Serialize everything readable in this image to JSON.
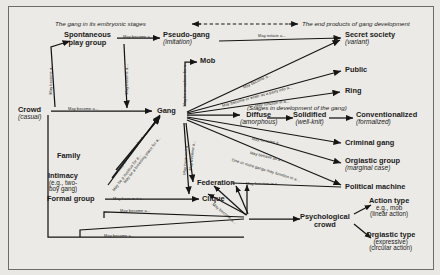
{
  "diagram": {
    "title_left": "The gang in its embryonic stages",
    "title_right": "The end products of gang development",
    "stages_caption": "(Stages in development of the gang)",
    "nodes": [
      {
        "id": "crowd",
        "bold": "Crowd",
        "ital": "(casual)"
      },
      {
        "id": "spontaneous",
        "bold": "Spontaneous",
        "bold2": "play group",
        "ital": ""
      },
      {
        "id": "pseudo",
        "bold": "Pseudo-gang",
        "ital": "(imitation)"
      },
      {
        "id": "gang",
        "bold": "Gang",
        "ital": ""
      },
      {
        "id": "mob",
        "bold": "Mob",
        "ital": ""
      },
      {
        "id": "secret",
        "bold": "Secret society",
        "ital": "(variant)"
      },
      {
        "id": "public",
        "bold": "Public",
        "ital": ""
      },
      {
        "id": "ring",
        "bold": "Ring",
        "ital": ""
      },
      {
        "id": "diffuse",
        "bold": "Diffuse",
        "ital": "(amorphous)"
      },
      {
        "id": "solidified",
        "bold": "Solidified",
        "ital": "(well-knit)"
      },
      {
        "id": "conventionalized",
        "bold": "Conventionalized",
        "ital": "(formalized)"
      },
      {
        "id": "criminal",
        "bold": "Criminal gang",
        "ital": ""
      },
      {
        "id": "orgiastic",
        "bold": "Orgiastic group",
        "ital": "(marginal case)"
      },
      {
        "id": "political",
        "bold": "Political machine",
        "ital": ""
      },
      {
        "id": "family",
        "bold": "Family",
        "ital": ""
      },
      {
        "id": "intimacy",
        "bold": "Intimacy",
        "plain": "(e.g., two-",
        "plain2": "boy gang)"
      },
      {
        "id": "formal",
        "bold": "Formal group",
        "ital": ""
      },
      {
        "id": "federation",
        "bold": "Federation",
        "ital": ""
      },
      {
        "id": "clique",
        "bold": "Clique",
        "ital": ""
      },
      {
        "id": "psychological",
        "bold": "Psychological",
        "bold2": "crowd",
        "ital": ""
      },
      {
        "id": "action_type",
        "bold": "Action type",
        "plain": "e.g., mob",
        "plain2": "(linear action)"
      },
      {
        "id": "orgiastic_type",
        "bold": "Orgiastic type",
        "plain": "(expressive)",
        "plain2": "(circular action)"
      }
    ],
    "edge_labels": {
      "crowd_to_gang": "May become a...",
      "crowd_up": "May become a...",
      "spont_to_pseudo": "May become a...",
      "spont_down_gang": "May become a...",
      "pseudo_to_secret": "May initiate a...",
      "gang_to_mob": "May be a nucleus for a...",
      "gang_to_secret": "May become a...",
      "gang_to_public": "May become or enter as a party into a...",
      "gang_to_ring": "May function in a...",
      "gang_to_criminal": "May become a...",
      "gang_to_orgiastic": "May behave as a...",
      "gang_to_political": "One or more gangs may function in a...",
      "formal_to_clique": "May have in it a...",
      "family_to_gang": "May be a nucleus for a...",
      "intimacy_to_gang": "May be a breeding place for a...",
      "formal_to_gang": "May be a nucleus for a...",
      "gang_to_federation": "May become a...",
      "gang_to_clique": "May have in it a...",
      "clique_lower": "May become a...",
      "formal_lower": "May become a...",
      "fed_to_political": "May function in a...",
      "psych_a": "May become a...",
      "psych_b": "May become a...",
      "psych_c": "May become a..."
    },
    "colors": {
      "page_bg": "#e9e8e4",
      "frame_bg": "#eceae6",
      "ink": "#1a1a1a",
      "frame_border": "#6d6c68"
    }
  }
}
